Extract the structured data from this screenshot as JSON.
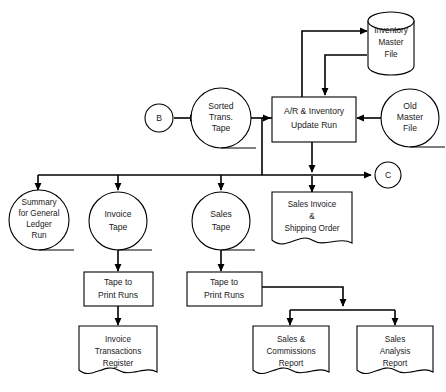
{
  "diagram": {
    "stroke_color": "#000000",
    "fill_color": "#ffffff",
    "text_color": "#1a1a1a"
  },
  "nodes": {
    "connector_b": {
      "label": "B",
      "type": "connector"
    },
    "connector_c": {
      "label": "C",
      "type": "connector"
    },
    "sorted_trans_tape": {
      "line1": "Sorted",
      "line2": "Trans.",
      "line3": "Tape",
      "type": "magnetic-tape"
    },
    "ar_inventory_update_run": {
      "line1": "A/R & Inventory",
      "line2": "Update Run",
      "type": "process"
    },
    "inventory_master_file": {
      "line1": "Inventory",
      "line2": "Master",
      "line3": "File",
      "type": "disk-storage"
    },
    "old_master_file": {
      "line1": "Old",
      "line2": "Master",
      "line3": "File",
      "type": "magnetic-tape"
    },
    "summary_general_ledger": {
      "line1": "Summary",
      "line2": "for General",
      "line3": "Ledger",
      "line4": "Run",
      "type": "magnetic-tape"
    },
    "invoice_tape": {
      "line1": "Invoice",
      "line2": "Tape",
      "type": "magnetic-tape"
    },
    "sales_tape": {
      "line1": "Sales",
      "line2": "Tape",
      "type": "magnetic-tape"
    },
    "sales_invoice_shipping_order": {
      "line1": "Sales Invoice",
      "line2": "&",
      "line3": "Shipping Order",
      "type": "document"
    },
    "tape_to_print_runs_left": {
      "line1": "Tape to",
      "line2": "Print Runs",
      "type": "process"
    },
    "tape_to_print_runs_right": {
      "line1": "Tape to",
      "line2": "Print Runs",
      "type": "process"
    },
    "invoice_transactions_register": {
      "line1": "Invoice",
      "line2": "Transactions",
      "line3": "Register",
      "type": "document"
    },
    "sales_commissions_report": {
      "line1": "Sales &",
      "line2": "Commissions",
      "line3": "Report",
      "type": "document"
    },
    "sales_analysis_report": {
      "line1": "Sales",
      "line2": "Analysis",
      "line3": "Report",
      "type": "document"
    }
  }
}
